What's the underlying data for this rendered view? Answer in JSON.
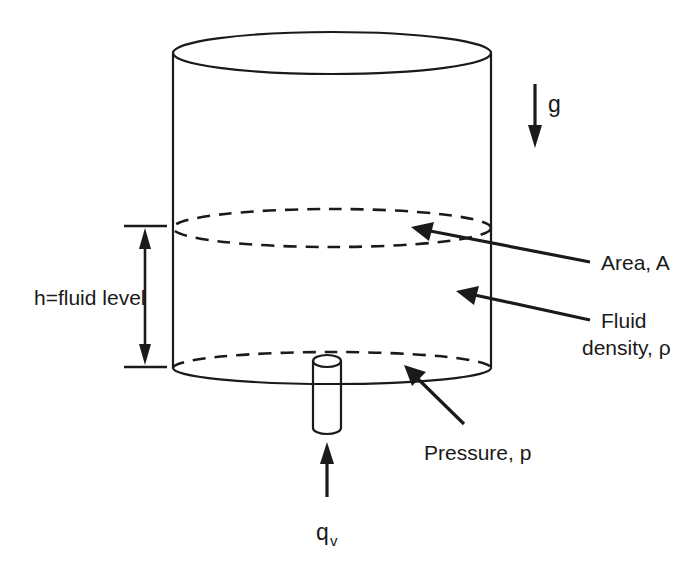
{
  "figure": {
    "type": "engineering-schematic",
    "background_color": "#ffffff",
    "line_color": "#1a1a1a"
  },
  "labels": {
    "gravity": "g",
    "fluid_level": "h=fluid level",
    "area": "Area, A",
    "fluid_density_line1": "Fluid",
    "fluid_density_line2": "density, ρ",
    "pressure": "Pressure, p",
    "flow_base": "q",
    "flow_sub": "v"
  },
  "annotations": [
    {
      "name": "gravity-arrow",
      "label": "g",
      "direction": "down",
      "points_to": "downward gravity vector"
    },
    {
      "name": "fluid-level-dimension",
      "label": "h=fluid level",
      "direction": "vertical-double",
      "points_to": "fluid column height"
    },
    {
      "name": "area-leader",
      "label": "Area, A",
      "direction": "arrow-left",
      "points_to": "fluid surface ellipse"
    },
    {
      "name": "density-leader",
      "label": "Fluid density, ρ",
      "direction": "arrow-left",
      "points_to": "tank fluid body"
    },
    {
      "name": "pressure-leader",
      "label": "Pressure, p",
      "direction": "arrow-up-left",
      "points_to": "tank base"
    },
    {
      "name": "flow-arrow",
      "label": "q_v",
      "direction": "up",
      "points_to": "inlet/outlet pipe"
    }
  ]
}
